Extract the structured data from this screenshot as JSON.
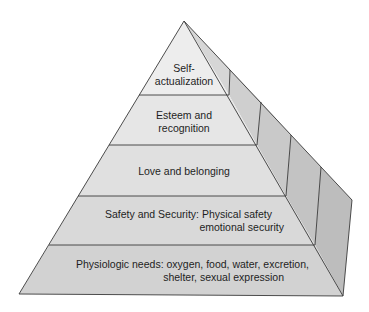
{
  "diagram": {
    "levels": [
      {
        "id": "self-actualization",
        "lines": [
          "Self-",
          "actualization"
        ]
      },
      {
        "id": "esteem",
        "lines": [
          "Esteem and",
          "recognition"
        ]
      },
      {
        "id": "love",
        "lines": [
          "Love and belonging"
        ]
      },
      {
        "id": "safety",
        "lines": [
          "Safety and Security: Physical safety",
          "emotional security"
        ]
      },
      {
        "id": "physiologic",
        "lines": [
          "Physiologic needs: oxygen, food, water, excretion,",
          "shelter, sexual expression"
        ]
      }
    ],
    "colors": {
      "background": "#ffffff",
      "band_1": "#ededed",
      "band_2": "#e6e6e6",
      "band_3": "#e0e0e0",
      "band_4": "#d9d9d9",
      "band_5": "#d2d2d2",
      "side_1": "#d6d6d6",
      "side_2": "#cfcfcf",
      "side_3": "#c9c9c9",
      "side_4": "#c3c3c3",
      "side_5": "#bdbdbd",
      "outline": "#3a3a3a",
      "text": "#1e1e1e"
    }
  }
}
